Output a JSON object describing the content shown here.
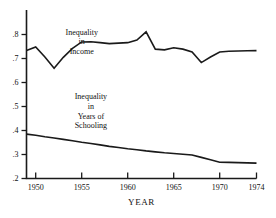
{
  "chart_data": {
    "type": "line",
    "title": "",
    "xlabel": "YEAR",
    "ylabel": "",
    "xlim": [
      1949,
      1974
    ],
    "ylim": [
      0.2,
      0.82
    ],
    "grid": false,
    "legend_position": "inline-annotations",
    "x_ticks": [
      "1950",
      "1955",
      "1960",
      "1965",
      "1970",
      "1974"
    ],
    "x_tick_values": [
      1950,
      1955,
      1960,
      1965,
      1970,
      1974
    ],
    "y_ticks": [
      ".8",
      ".7",
      ".6",
      ".5",
      ".4",
      ".3",
      ".2"
    ],
    "y_tick_values": [
      0.8,
      0.7,
      0.6,
      0.5,
      0.4,
      0.3,
      0.2
    ],
    "annotations": [
      {
        "name": "income-label",
        "lines": [
          "Inequality",
          "in",
          "Income"
        ],
        "x": 1955.0,
        "y": 0.8
      },
      {
        "name": "schooling-label",
        "lines": [
          "Inequality",
          "in",
          "Years of",
          "Schooling"
        ],
        "x": 1956.0,
        "y": 0.53
      }
    ],
    "x": [
      1949,
      1950,
      1951,
      1952,
      1953,
      1954,
      1955,
      1956,
      1957,
      1958,
      1959,
      1960,
      1961,
      1962,
      1963,
      1964,
      1965,
      1966,
      1967,
      1968,
      1969,
      1970,
      1971,
      1972,
      1973,
      1974
    ],
    "series": [
      {
        "name": "Inequality in Income",
        "values": [
          0.733,
          0.748,
          0.706,
          0.659,
          0.705,
          0.742,
          0.769,
          0.77,
          0.766,
          0.762,
          0.764,
          0.766,
          0.777,
          0.811,
          0.739,
          0.736,
          0.745,
          0.739,
          0.727,
          0.683,
          0.706,
          0.727,
          0.73,
          0.731,
          0.732,
          0.733
        ]
      },
      {
        "name": "Inequality in Years of Schooling",
        "values": [
          0.385,
          0.38,
          0.374,
          0.369,
          0.363,
          0.357,
          0.351,
          0.346,
          0.34,
          0.334,
          0.329,
          0.324,
          0.32,
          0.315,
          0.311,
          0.307,
          0.304,
          0.301,
          0.298,
          0.288,
          0.278,
          0.268,
          0.267,
          0.266,
          0.265,
          0.264
        ]
      }
    ]
  },
  "axis": {
    "x_title": "YEAR"
  }
}
